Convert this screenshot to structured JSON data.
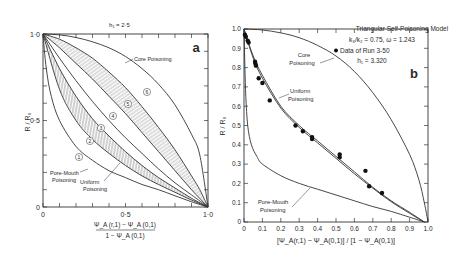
{
  "chart_data": [
    {
      "panel": "a",
      "type": "line",
      "title": "h1 = 2.5",
      "xlabel": "[ΨA(r,1) − ΨA(0,1)] / [1 − ΨA(0,1)]",
      "ylabel": "R/R0",
      "xlim": [
        0,
        1.0
      ],
      "ylim": [
        0,
        1.0
      ],
      "x_ticks": [
        "0",
        "0.5",
        "1.0"
      ],
      "y_ticks": [
        "0",
        "0.5",
        "1.0"
      ],
      "grid": false,
      "panel_label": "a",
      "curves": [
        {
          "name": "Pore-Mouth Poisoning",
          "id": "1",
          "x": [
            0,
            0.02,
            0.05,
            0.1,
            0.2,
            0.3,
            0.4,
            0.5,
            0.6,
            0.7,
            0.8,
            0.9,
            1.0
          ],
          "y": [
            1.0,
            0.8,
            0.64,
            0.5,
            0.35,
            0.27,
            0.21,
            0.17,
            0.13,
            0.1,
            0.065,
            0.03,
            0
          ]
        },
        {
          "name": "Curve 2",
          "id": "2",
          "x": [
            0,
            0.1,
            0.2,
            0.3,
            0.4,
            0.5,
            0.6,
            0.7,
            0.8,
            0.9,
            1.0
          ],
          "y": [
            1.0,
            0.68,
            0.5,
            0.39,
            0.31,
            0.24,
            0.18,
            0.13,
            0.085,
            0.04,
            0
          ]
        },
        {
          "name": "Uniform Poisoning",
          "id": "3",
          "x": [
            0,
            0.1,
            0.2,
            0.3,
            0.4,
            0.5,
            0.6,
            0.7,
            0.8,
            0.9,
            1.0
          ],
          "y": [
            1.0,
            0.8,
            0.64,
            0.51,
            0.41,
            0.32,
            0.24,
            0.17,
            0.11,
            0.05,
            0
          ]
        },
        {
          "name": "Curve 4",
          "id": "4",
          "x": [
            0,
            0.1,
            0.2,
            0.3,
            0.4,
            0.5,
            0.6,
            0.7,
            0.8,
            0.9,
            1.0
          ],
          "y": [
            1.0,
            0.86,
            0.73,
            0.61,
            0.5,
            0.4,
            0.31,
            0.22,
            0.14,
            0.07,
            0
          ]
        },
        {
          "name": "Curve 5",
          "id": "5",
          "x": [
            0,
            0.1,
            0.2,
            0.3,
            0.4,
            0.5,
            0.6,
            0.7,
            0.8,
            0.9,
            1.0
          ],
          "y": [
            1.0,
            0.92,
            0.83,
            0.74,
            0.64,
            0.54,
            0.43,
            0.32,
            0.21,
            0.1,
            0
          ]
        },
        {
          "name": "Curve 6",
          "id": "6",
          "x": [
            0,
            0.1,
            0.2,
            0.3,
            0.4,
            0.5,
            0.6,
            0.7,
            0.8,
            0.9,
            0.95,
            1.0
          ],
          "y": [
            1.0,
            0.97,
            0.92,
            0.86,
            0.78,
            0.69,
            0.58,
            0.46,
            0.33,
            0.18,
            0.1,
            0
          ]
        },
        {
          "name": "Core Poisoning",
          "id": "core",
          "x": [
            0,
            0.1,
            0.2,
            0.3,
            0.4,
            0.5,
            0.6,
            0.7,
            0.8,
            0.9,
            0.95,
            1.0
          ],
          "y": [
            1.0,
            0.995,
            0.98,
            0.955,
            0.92,
            0.87,
            0.8,
            0.71,
            0.59,
            0.42,
            0.3,
            0
          ]
        }
      ],
      "annotations": [
        "Core Poisoning",
        "Pore-Mouth Poisoning",
        "Uniform Poisoning",
        "1",
        "2",
        "3",
        "4",
        "5",
        "6"
      ]
    },
    {
      "panel": "b",
      "type": "line",
      "title": "Triangular Self-Poisoning Model",
      "subtitle": "k3/k2 = 0.75, ω = 1.243",
      "legend": [
        "● Data of Run 3-50",
        "h1 = 3.320"
      ],
      "xlabel": "[ΨA(r,1) − ΨA(0,1)] / [1 − ΨA(0,1)]",
      "ylabel": "R/R0",
      "xlim": [
        0,
        1.0
      ],
      "ylim": [
        0,
        1.0
      ],
      "x_ticks": [
        "0",
        "0.1",
        "0.2",
        "0.3",
        "0.4",
        "0.5",
        "0.6",
        "0.7",
        "0.8",
        "0.9",
        "1.0"
      ],
      "y_ticks": [
        "0",
        "0.1",
        "0.2",
        "0.3",
        "0.4",
        "0.5",
        "0.6",
        "0.7",
        "0.8",
        "0.9",
        "1.0"
      ],
      "grid": false,
      "panel_label": "b",
      "curves": [
        {
          "name": "Core Poisoning",
          "x": [
            0,
            0.1,
            0.2,
            0.3,
            0.4,
            0.5,
            0.6,
            0.7,
            0.8,
            0.9,
            0.95,
            0.98,
            1.0
          ],
          "y": [
            1.0,
            0.995,
            0.98,
            0.955,
            0.915,
            0.86,
            0.78,
            0.67,
            0.53,
            0.35,
            0.22,
            0.1,
            0
          ]
        },
        {
          "name": "Uniform Poisoning (upper)",
          "x": [
            0,
            0.05,
            0.1,
            0.2,
            0.3,
            0.4,
            0.5,
            0.6,
            0.7,
            0.8,
            0.9,
            0.98
          ],
          "y": [
            1.0,
            0.86,
            0.76,
            0.6,
            0.5,
            0.42,
            0.34,
            0.26,
            0.18,
            0.11,
            0.05,
            0
          ]
        },
        {
          "name": "Uniform Poisoning (lower)",
          "x": [
            0,
            0.05,
            0.1,
            0.2,
            0.3,
            0.4,
            0.5,
            0.6,
            0.7,
            0.8,
            0.9,
            0.98
          ],
          "y": [
            1.0,
            0.85,
            0.745,
            0.59,
            0.49,
            0.41,
            0.33,
            0.25,
            0.175,
            0.105,
            0.045,
            0
          ]
        },
        {
          "name": "Pore-Mouth Poisoning",
          "x": [
            0,
            0.005,
            0.01,
            0.02,
            0.04,
            0.07,
            0.1,
            0.2,
            0.3,
            0.4,
            0.5,
            0.6,
            0.7,
            0.8,
            0.9,
            0.98
          ],
          "y": [
            1.0,
            0.8,
            0.65,
            0.5,
            0.4,
            0.34,
            0.3,
            0.24,
            0.2,
            0.17,
            0.14,
            0.11,
            0.08,
            0.055,
            0.025,
            0
          ]
        }
      ],
      "scatter": {
        "name": "Data of Run 3-50",
        "x": [
          0.005,
          0.01,
          0.02,
          0.025,
          0.06,
          0.062,
          0.065,
          0.08,
          0.1,
          0.14,
          0.28,
          0.32,
          0.37,
          0.37,
          0.52,
          0.52,
          0.66,
          0.68,
          0.75
        ],
        "y": [
          0.97,
          0.96,
          0.94,
          0.93,
          0.83,
          0.82,
          0.81,
          0.745,
          0.72,
          0.63,
          0.5,
          0.47,
          0.44,
          0.43,
          0.35,
          0.335,
          0.265,
          0.185,
          0.15
        ]
      },
      "annotations": [
        "Core Poisoning",
        "Uniform Poisoning",
        "Pore-Mouth Poisoning"
      ]
    }
  ],
  "panel_a": {
    "title": "h₁ = 2·5",
    "label": "a",
    "ylabel": "R / R₀",
    "xlabel_num": "Ψ_A (r,1) − Ψ_A (0,1)",
    "xlabel_den": "1 − Ψ_A (0,1)",
    "x_ticks": [
      "0",
      "0·5",
      "1·0"
    ],
    "y_ticks": [
      "0",
      "0·5",
      "1·0"
    ],
    "core_label": "Core Poisoning",
    "pore_label_1": "Pore-Mouth",
    "pore_label_2": "Poisoning",
    "uniform_label_1": "Uniform",
    "uniform_label_2": "Poisoning",
    "circle_labels": [
      "1",
      "2",
      "3",
      "4",
      "5",
      "6"
    ]
  },
  "panel_b": {
    "label": "b",
    "ylabel": "R / R₀",
    "xlabel": "[Ψ_A(r,1) − Ψ_A(0,1)] / [1 − Ψ_A(0,1)]",
    "x_ticks": [
      "0",
      "0.1",
      "0.2",
      "0.3",
      "0.4",
      "0.5",
      "0.6",
      "0.7",
      "0.8",
      "0.9",
      "1.0"
    ],
    "y_ticks": [
      "0",
      "0.1",
      "0.2",
      "0.3",
      "0.4",
      "0.5",
      "0.6",
      "0.7",
      "0.8",
      "0.9",
      "1.0"
    ],
    "legend_title": "Triangular Self-Poisoning Model",
    "legend_params": "k₃/k₂ = 0.75, ω = 1.243",
    "legend_data": "Data of Run 3-50",
    "legend_h": "h₁ = 3.320",
    "core_label_1": "Core",
    "core_label_2": "Poisoning",
    "uniform_label_1": "Uniform",
    "uniform_label_2": "Poisoning",
    "pore_label_1": "Pore-Mouth",
    "pore_label_2": "Poisoning"
  }
}
